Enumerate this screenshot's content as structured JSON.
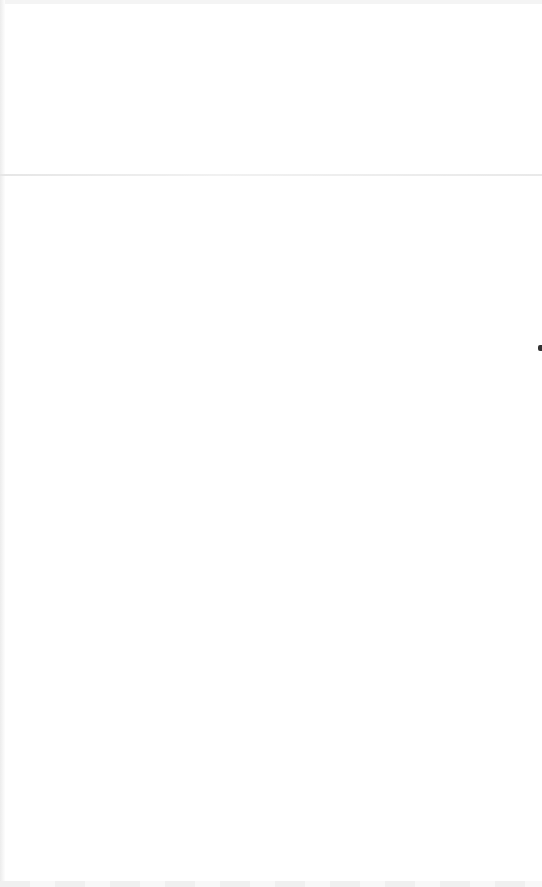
{
  "page": {
    "content": ""
  },
  "colors": {
    "background": "#ffffff",
    "divider": "#e6e6e6",
    "edge_mark": "#333333"
  }
}
